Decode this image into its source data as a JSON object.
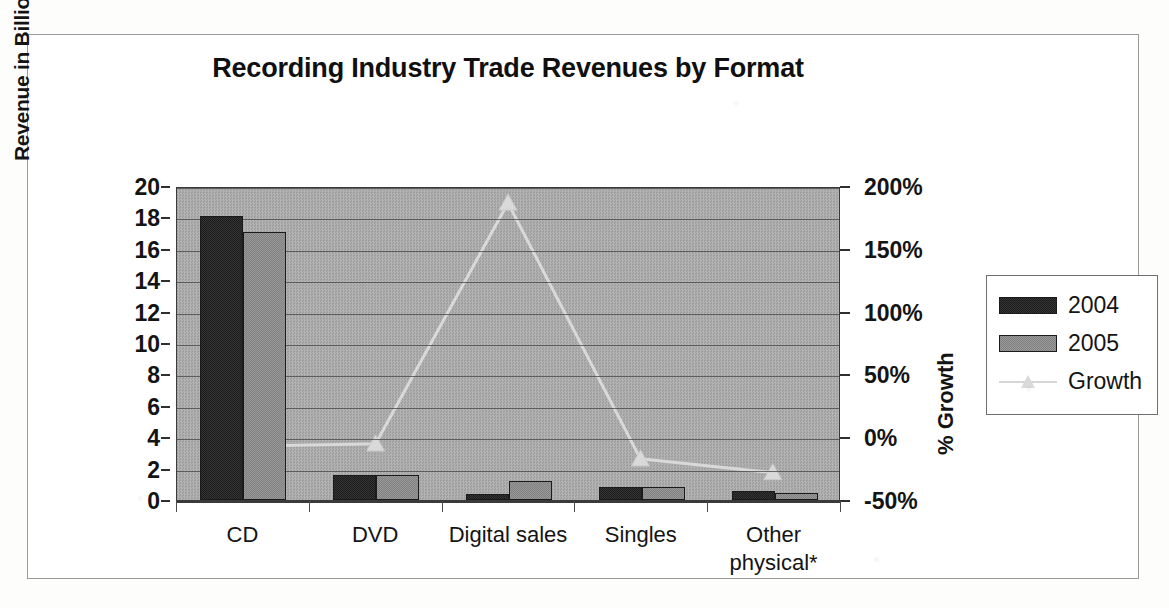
{
  "chart_data": {
    "type": "bar",
    "title": "Recording Industry Trade Revenues by Format",
    "categories": [
      "CD",
      "DVD",
      "Digital sales",
      "Singles",
      "Other\nphysical*"
    ],
    "series": [
      {
        "name": "2004",
        "axis": "left",
        "values": [
          18.1,
          1.6,
          0.4,
          0.85,
          0.6
        ]
      },
      {
        "name": "2005",
        "axis": "left",
        "values": [
          17.1,
          1.6,
          1.2,
          0.85,
          0.45
        ]
      },
      {
        "name": "Growth",
        "axis": "right",
        "type": "line",
        "values": [
          -7,
          -5,
          188,
          -17,
          -28
        ]
      }
    ],
    "ylabel": "Revenue in Billions of US$",
    "ylabel_right": "% Growth",
    "xlabel": "",
    "ylim": [
      0,
      20
    ],
    "ylim_right": [
      -50,
      200
    ],
    "yticks": [
      "20",
      "18",
      "16",
      "14",
      "12",
      "10",
      "8",
      "6",
      "4",
      "2",
      "0"
    ],
    "ytick_values": [
      20,
      18,
      16,
      14,
      12,
      10,
      8,
      6,
      4,
      2,
      0
    ],
    "yticks_right": [
      "200%",
      "150%",
      "100%",
      "50%",
      "0%",
      "-50%"
    ],
    "ytick_right_values": [
      200,
      150,
      100,
      50,
      0,
      -50
    ],
    "grid": true,
    "legend_position": "right",
    "legend": [
      "2004",
      "2005",
      "Growth"
    ],
    "colors": {
      "series_2004": "#2b2b2b",
      "series_2005": "#8d8d8d",
      "growth_line": "#d9d9d9",
      "plot_background": "#a9a9a9",
      "gridline": "#4a4a4a",
      "text": "#141414"
    }
  },
  "footnote": "*"
}
